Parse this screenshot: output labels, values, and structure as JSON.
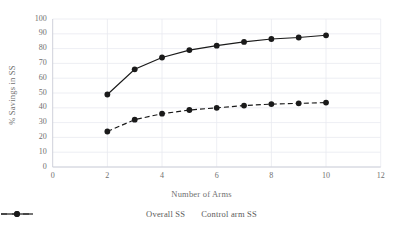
{
  "chart_data": {
    "type": "line",
    "title": "",
    "xlabel": "Number of Arms",
    "ylabel": "% Savings in SS",
    "x": [
      2,
      3,
      4,
      5,
      6,
      7,
      8,
      9,
      10
    ],
    "series": [
      {
        "name": "Overall SS",
        "style": "dashed",
        "marker": "circle",
        "color": "#1a1a1a",
        "values": [
          24,
          32,
          36,
          38.5,
          40,
          41.5,
          42.5,
          43,
          43.5
        ]
      },
      {
        "name": "Control arm SS",
        "style": "solid",
        "marker": "circle",
        "color": "#1a1a1a",
        "values": [
          49,
          66,
          74,
          79,
          82,
          84.5,
          86.5,
          87.5,
          89
        ]
      }
    ],
    "xlim": [
      0,
      12
    ],
    "ylim": [
      0,
      100
    ],
    "xticks": [
      0,
      2,
      4,
      6,
      8,
      10,
      12
    ],
    "yticks": [
      0,
      10,
      20,
      30,
      40,
      50,
      60,
      70,
      80,
      90,
      100
    ],
    "grid": true,
    "grid_color": "#e8eaf0",
    "legend_position": "bottom",
    "legend": [
      "Overall SS",
      "Control arm SS"
    ]
  }
}
